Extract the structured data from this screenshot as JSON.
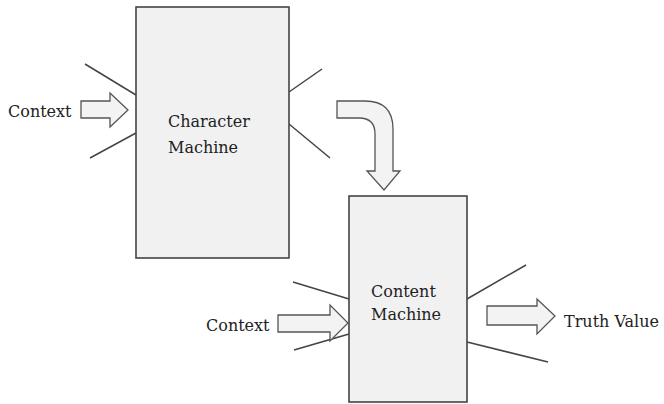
{
  "diagram": {
    "character_machine": {
      "line1": "Character",
      "line2": "Machine",
      "input_label": "Context"
    },
    "content_machine": {
      "line1": "Content",
      "line2": "Machine",
      "input_label": "Context",
      "output_label": "Truth Value"
    },
    "connector": "curved-down-arrow",
    "colors": {
      "box_fill": "#f1f1f1",
      "stroke": "#444444",
      "text": "#222222"
    }
  }
}
